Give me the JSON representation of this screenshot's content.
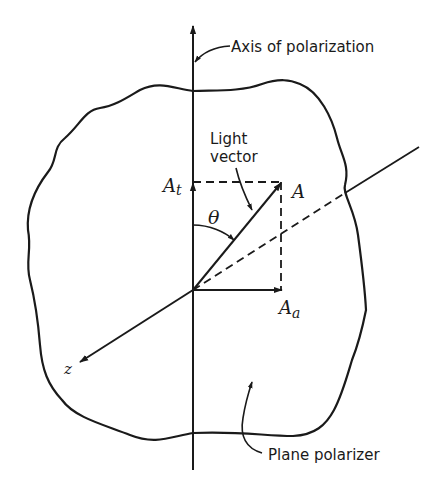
{
  "diagram": {
    "labels": {
      "axis_of_polarization": "Axis of polarization",
      "light_vector_line1": "Light",
      "light_vector_line2": "vector",
      "plane_polarizer": "Plane polarizer",
      "A": "A",
      "A_t_base": "A",
      "A_t_sub": "t",
      "A_a_base": "A",
      "A_a_sub": "a",
      "theta": "θ",
      "z": "z"
    },
    "colors": {
      "ink": "#1a1a1a",
      "background": "#ffffff"
    }
  }
}
